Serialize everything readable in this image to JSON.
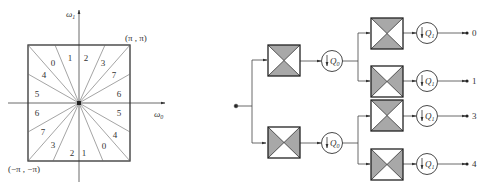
{
  "frequency_plane": {
    "x_axis_label": "ω",
    "x_axis_sub": "0",
    "y_axis_label": "ω",
    "y_axis_sub": "1",
    "corner_top_right": "(π , π)",
    "corner_bottom_left": "(−π , −π)",
    "region_labels": [
      {
        "text": "0",
        "x": 53,
        "y": 66
      },
      {
        "text": "1",
        "x": 70,
        "y": 61
      },
      {
        "text": "2",
        "x": 86,
        "y": 61
      },
      {
        "text": "3",
        "x": 103,
        "y": 66
      },
      {
        "text": "4",
        "x": 44,
        "y": 78
      },
      {
        "text": "7",
        "x": 114,
        "y": 78
      },
      {
        "text": "5",
        "x": 37,
        "y": 97
      },
      {
        "text": "6",
        "x": 119,
        "y": 97
      },
      {
        "text": "6",
        "x": 37,
        "y": 116
      },
      {
        "text": "5",
        "x": 119,
        "y": 116
      },
      {
        "text": "7",
        "x": 43,
        "y": 135
      },
      {
        "text": "4",
        "x": 115,
        "y": 138
      },
      {
        "text": "3",
        "x": 53,
        "y": 148
      },
      {
        "text": "0",
        "x": 104,
        "y": 149
      },
      {
        "text": "2",
        "x": 72,
        "y": 156
      },
      {
        "text": "1",
        "x": 84,
        "y": 156
      }
    ],
    "line_color": "#555555"
  },
  "filter_bank": {
    "stage1_downsampler": "Q",
    "stage1_sub": "0",
    "stage2_downsampler": "Q",
    "stage2_sub": "1",
    "outputs": [
      "0",
      "1",
      "3",
      "4"
    ],
    "shade_color": "#a8a8a8",
    "line_color": "#444444"
  }
}
